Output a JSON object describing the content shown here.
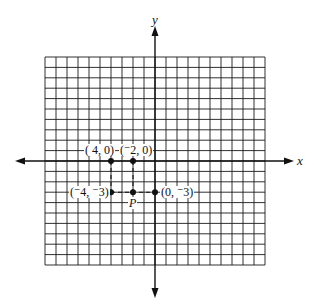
{
  "diagram": {
    "type": "coordinate-grid",
    "axes": {
      "x_label": "x",
      "y_label": "y",
      "x_range": [
        -10,
        10
      ],
      "y_range": [
        -10,
        10
      ],
      "grid_step": 1
    },
    "points": [
      {
        "id": "pt-neg4-0",
        "x": -4,
        "y": 0,
        "label": "( 4, 0)"
      },
      {
        "id": "pt-neg2-0",
        "x": -2,
        "y": 0,
        "label": "(⁻2, 0)"
      },
      {
        "id": "pt-neg4-neg3",
        "x": -4,
        "y": -3,
        "label": "(⁻4, ⁻3)"
      },
      {
        "id": "pt-P",
        "x": -2,
        "y": -3,
        "label": "P"
      },
      {
        "id": "pt-0-neg3",
        "x": 0,
        "y": -3,
        "label": "(0, ⁻3)"
      }
    ],
    "dashed_guides": [
      {
        "from": [
          -4,
          0
        ],
        "to": [
          -4,
          -3
        ]
      },
      {
        "from": [
          -2,
          0
        ],
        "to": [
          -2,
          -3
        ]
      },
      {
        "from": [
          -4,
          -3
        ],
        "to": [
          0,
          -3
        ]
      }
    ],
    "colors": {
      "ink": "#111111",
      "grid": "#1a1a1a",
      "background": "#ffffff"
    }
  }
}
